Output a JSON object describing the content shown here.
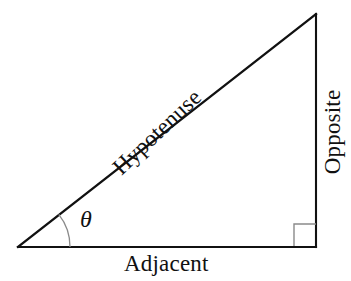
{
  "figure": {
    "type": "right-triangle-trigonometry-diagram",
    "background_color": "#ffffff",
    "stroke_color": "#111111",
    "light_stroke_color": "#808080"
  },
  "labels": {
    "hypotenuse": "Hypotenuse",
    "opposite": "Opposite",
    "adjacent": "Adjacent",
    "angle": "θ"
  },
  "geometry": {
    "vertices": {
      "left": {
        "x": 18,
        "y": 247
      },
      "bottom_right": {
        "x": 316,
        "y": 247
      },
      "top_right": {
        "x": 316,
        "y": 14
      }
    },
    "angle_arc": {
      "center_x": 18,
      "center_y": 247,
      "radius": 52
    },
    "right_angle_marker": {
      "x": 294,
      "y": 224,
      "size": 22
    }
  }
}
